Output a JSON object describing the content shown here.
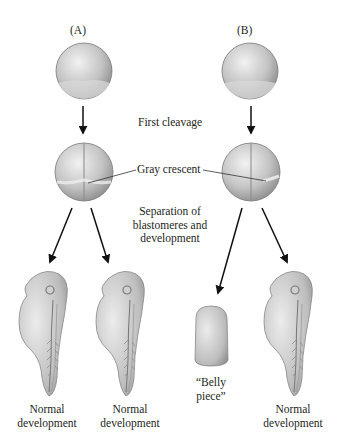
{
  "panels": {
    "a": {
      "label": "(A)"
    },
    "b": {
      "label": "(B)"
    }
  },
  "steps": {
    "first_cleavage": "First cleavage",
    "gray_crescent": "Gray crescent",
    "separation_line1": "Separation of",
    "separation_line2": "blastomeres and",
    "separation_line3": "development"
  },
  "outcomes": {
    "a_left": {
      "line1": "Normal",
      "line2": "development"
    },
    "a_right": {
      "line1": "Normal",
      "line2": "development"
    },
    "b_left": {
      "line1": "“Belly",
      "line2": "piece”"
    },
    "b_right": {
      "line1": "Normal",
      "line2": "development"
    }
  },
  "colors": {
    "egg_light": "#e6e6e6",
    "egg_dark": "#8a8a8a",
    "embryo": "#c9c9c9",
    "arrow": "#111111"
  }
}
